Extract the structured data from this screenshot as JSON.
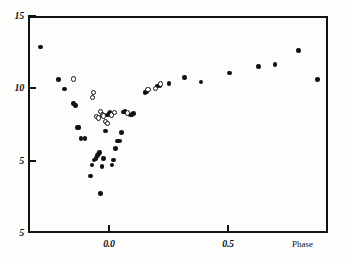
{
  "figure": {
    "background_color": "#fdfdfc",
    "ink_color": "#111111"
  },
  "axes": {
    "x_caption": "Phase",
    "x_ticks": [
      {
        "value": 0.0,
        "label": "0.0"
      },
      {
        "value": 0.5,
        "label": "0.5"
      }
    ],
    "y_ticks": [
      {
        "value": 0,
        "label": "5"
      },
      {
        "value": 5,
        "label": "5"
      },
      {
        "value": 10,
        "label": "10"
      },
      {
        "value": 15,
        "label": "15"
      }
    ]
  },
  "chart_data": {
    "type": "scatter",
    "title": "",
    "xlabel": "Phase",
    "ylabel": "",
    "xlim": [
      -0.34,
      0.92
    ],
    "ylim": [
      15,
      0
    ],
    "y_inverted": true,
    "grid": false,
    "legend": "none",
    "x_ticks": [
      0.0,
      0.5
    ],
    "x_ticklabels": [
      "0.0",
      "0.5"
    ],
    "y_ticks": [
      0,
      5,
      10,
      15
    ],
    "y_ticklabels": [
      "5",
      "5",
      "10",
      "15"
    ],
    "annotations": [
      "Phase"
    ],
    "series": [
      {
        "name": "filled-circles",
        "marker": "filled circle",
        "color": "#111111",
        "points": [
          [
            -0.287,
            12.85
          ],
          [
            -0.212,
            10.6
          ],
          [
            -0.186,
            9.95
          ],
          [
            -0.148,
            8.95
          ],
          [
            -0.141,
            8.8
          ],
          [
            -0.133,
            7.3
          ],
          [
            -0.125,
            7.3
          ],
          [
            -0.118,
            6.55
          ],
          [
            -0.1,
            6.55
          ],
          [
            -0.078,
            3.95
          ],
          [
            -0.072,
            4.7
          ],
          [
            -0.063,
            5.05
          ],
          [
            -0.055,
            5.15
          ],
          [
            -0.048,
            5.35
          ],
          [
            -0.044,
            5.45
          ],
          [
            -0.04,
            5.55
          ],
          [
            -0.036,
            2.75
          ],
          [
            -0.03,
            4.6
          ],
          [
            -0.022,
            5.15
          ],
          [
            -0.014,
            7.05
          ],
          [
            -0.007,
            8.15
          ],
          [
            0.0,
            8.3
          ],
          [
            0.004,
            8.35
          ],
          [
            0.012,
            4.7
          ],
          [
            0.018,
            5.05
          ],
          [
            0.027,
            5.85
          ],
          [
            0.035,
            6.35
          ],
          [
            0.044,
            6.35
          ],
          [
            0.052,
            6.95
          ],
          [
            0.061,
            8.35
          ],
          [
            0.067,
            8.4
          ],
          [
            0.09,
            8.15
          ],
          [
            0.097,
            8.2
          ],
          [
            0.104,
            8.25
          ],
          [
            0.152,
            9.7
          ],
          [
            0.16,
            9.8
          ],
          [
            0.205,
            10.15
          ],
          [
            0.215,
            10.2
          ],
          [
            0.252,
            10.35
          ],
          [
            0.318,
            10.75
          ],
          [
            0.386,
            10.45
          ],
          [
            0.506,
            11.05
          ],
          [
            0.628,
            11.5
          ],
          [
            0.698,
            11.65
          ],
          [
            0.795,
            12.6
          ],
          [
            0.875,
            10.6
          ]
        ]
      },
      {
        "name": "open-circles",
        "marker": "open circle",
        "color": "#111111",
        "points": [
          [
            -0.15,
            10.65
          ],
          [
            -0.07,
            9.35
          ],
          [
            -0.065,
            9.7
          ],
          [
            -0.053,
            8.05
          ],
          [
            -0.043,
            7.95
          ],
          [
            -0.035,
            8.4
          ],
          [
            -0.028,
            8.15
          ],
          [
            -0.022,
            8.1
          ],
          [
            -0.014,
            7.7
          ],
          [
            -0.006,
            7.55
          ],
          [
            0.01,
            8.15
          ],
          [
            0.024,
            8.35
          ],
          [
            0.078,
            8.3
          ],
          [
            0.164,
            9.9
          ],
          [
            0.196,
            10.0
          ],
          [
            0.216,
            10.3
          ]
        ]
      }
    ]
  }
}
